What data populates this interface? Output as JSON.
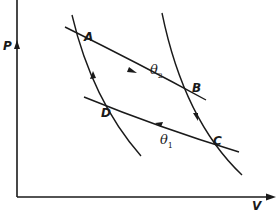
{
  "diagram": {
    "type": "Carnot cycle P-V diagram",
    "axes": {
      "y_label": "P",
      "x_label": "V"
    },
    "points": [
      {
        "id": "A",
        "label": "A"
      },
      {
        "id": "B",
        "label": "B"
      },
      {
        "id": "C",
        "label": "C"
      },
      {
        "id": "D",
        "label": "D"
      }
    ],
    "isotherms": [
      {
        "name": "upper",
        "symbol": "θ",
        "subscript": "2",
        "direction": "A to B"
      },
      {
        "name": "lower",
        "symbol": "θ",
        "subscript": "1",
        "direction": "C to D"
      }
    ],
    "adiabats": [
      {
        "name": "right",
        "direction": "B to C"
      },
      {
        "name": "left",
        "direction": "D to A"
      }
    ],
    "colors": {
      "line": "#1a1a1a",
      "background": "#ffffff"
    }
  }
}
